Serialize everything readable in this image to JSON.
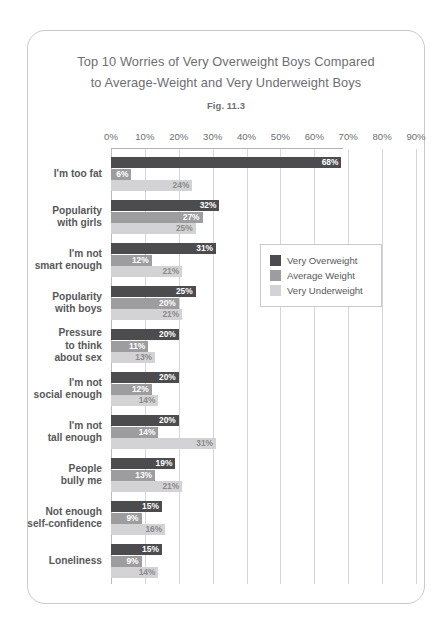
{
  "chart_data": {
    "type": "bar",
    "orientation": "horizontal",
    "title": "Top 10 Worries of Very Overweight Boys Compared to Average-Weight and Very Underweight Boys",
    "title_lines": [
      "Top 10 Worries of Very Overweight Boys Compared",
      "to Average-Weight and Very Underweight Boys"
    ],
    "figure_label": "Fig. 11.3",
    "xlabel": "",
    "ylabel": "",
    "xlim": [
      0,
      90
    ],
    "xticks": [
      0,
      10,
      20,
      30,
      40,
      50,
      60,
      70,
      80,
      90
    ],
    "xtick_labels": [
      "0%",
      "10%",
      "20%",
      "30%",
      "40%",
      "50%",
      "60%",
      "70%",
      "80%",
      "90%"
    ],
    "grid": true,
    "legend_position": "center-right",
    "categories": [
      "I'm too fat",
      "Popularity with girls",
      "I'm not smart enough",
      "Popularity with boys",
      "Pressure to think about sex",
      "I'm not social enough",
      "I'm not tall enough",
      "People bully me",
      "Not enough self-confidence",
      "Loneliness"
    ],
    "category_label_lines": [
      "I'm too fat",
      "Popularity\nwith girls",
      "I'm not\nsmart enough",
      "Popularity\nwith boys",
      "Pressure\nto think\nabout sex",
      "I'm not\nsocial enough",
      "I'm not\ntall enough",
      "People\nbully me",
      "Not enough\nself-confidence",
      "Loneliness"
    ],
    "series": [
      {
        "name": "Very Overweight",
        "color": "#4c4c4e",
        "values": [
          68,
          32,
          31,
          25,
          20,
          20,
          20,
          19,
          15,
          15
        ],
        "value_labels": [
          "68%",
          "32%",
          "31%",
          "25%",
          "20%",
          "20%",
          "20%",
          "19%",
          "15%",
          "15%"
        ]
      },
      {
        "name": "Average Weight",
        "color": "#9d9da0",
        "values": [
          6,
          27,
          12,
          20,
          11,
          12,
          14,
          13,
          9,
          9
        ],
        "value_labels": [
          "6%",
          "27%",
          "12%",
          "20%",
          "11%",
          "12%",
          "14%",
          "13%",
          "9%",
          "9%"
        ]
      },
      {
        "name": "Very Underweight",
        "color": "#d3d3d5",
        "values": [
          24,
          25,
          21,
          21,
          13,
          14,
          31,
          21,
          16,
          14
        ],
        "value_labels": [
          "24%",
          "25%",
          "21%",
          "21%",
          "13%",
          "14%",
          "31%",
          "21%",
          "16%",
          "14%"
        ]
      }
    ]
  }
}
